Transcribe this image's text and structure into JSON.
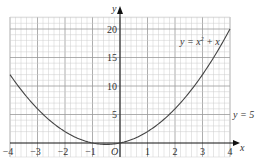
{
  "chart_data": {
    "type": "line",
    "title": "",
    "xlabel": "x",
    "ylabel": "y",
    "xlim": [
      -4,
      4
    ],
    "ylim": [
      -2.5,
      22
    ],
    "grid": true,
    "x_ticks": [
      -4,
      -3,
      -2,
      -1,
      1,
      2,
      3,
      4
    ],
    "y_ticks": [
      5,
      10,
      15,
      20
    ],
    "origin_label": "O",
    "series": [
      {
        "name": "y = x² + x",
        "x": [
          -4,
          -3.5,
          -3,
          -2.5,
          -2,
          -1.5,
          -1,
          -0.5,
          0,
          0.5,
          1,
          1.5,
          2,
          2.5,
          3,
          3.5,
          4
        ],
        "values": [
          12,
          8.75,
          6,
          3.75,
          2,
          0.75,
          0,
          -0.25,
          0,
          0.75,
          2,
          3.75,
          6,
          8.75,
          12,
          15.75,
          20
        ]
      }
    ],
    "annotations": [
      {
        "text": "y = x² + x",
        "position": "upper right near curve"
      },
      {
        "text": "y = 5",
        "position": "right edge at y=5"
      }
    ]
  },
  "labels": {
    "x_axis": "x",
    "y_axis": "y",
    "origin": "O",
    "curve_label_pre": "y = x",
    "curve_label_sup": "2",
    "curve_label_post": " + x",
    "line_label": "y = 5",
    "xticks": [
      "−4",
      "−3",
      "−2",
      "−1",
      "1",
      "2",
      "3",
      "4"
    ],
    "yticks": [
      "5",
      "10",
      "15",
      "20"
    ]
  }
}
